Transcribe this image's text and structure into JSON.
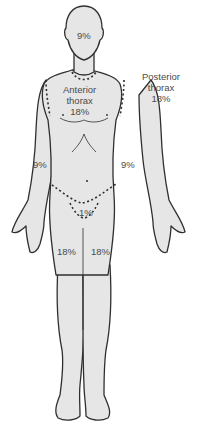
{
  "diagram": {
    "colors": {
      "skin": "#e6e6e6",
      "outline": "#2f2f2f",
      "text": "#4a4a4a",
      "background": "#ffffff"
    },
    "labels": {
      "head": "9%",
      "anterior_thorax": [
        "Anterior",
        "thorax",
        "18%"
      ],
      "posterior_thorax": [
        "Posterior",
        "thorax",
        "18%"
      ],
      "left_arm": "9%",
      "right_arm": "9%",
      "perineum": "1%",
      "left_leg": "18%",
      "right_leg": "18%"
    }
  }
}
